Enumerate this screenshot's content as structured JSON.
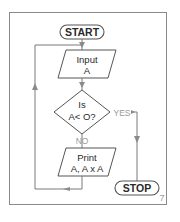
{
  "flowchart": {
    "start_label": "START",
    "input_line1": "Input",
    "input_line2": "A",
    "decision_line1": "Is",
    "decision_line2": "A< O?",
    "yes_label": "YES",
    "no_label": "NO",
    "print_line1": "Print",
    "print_line2": "A, A x A",
    "stop_label": "STOP"
  },
  "page_number": "7",
  "colors": {
    "line": "#7a7a7a",
    "frame": "#8a8a8a",
    "text": "#2a2a2a",
    "muted_text": "#9a9a9a"
  }
}
